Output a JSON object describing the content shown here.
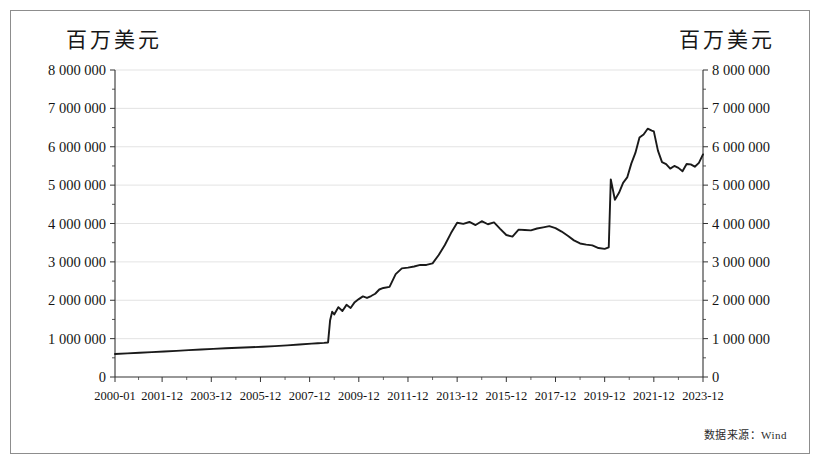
{
  "figure": {
    "left_axis_title": "百万美元",
    "right_axis_title": "百万美元",
    "source_note": "数据来源：Wind",
    "frame_color": "#8d8d8d",
    "line_color": "#1a1a1a",
    "grid_color": "#dcdcdc"
  },
  "chart_data": {
    "type": "line",
    "title": "",
    "subtitle": "",
    "xlabel": "",
    "ylabel": "百万美元",
    "y2label": "百万美元",
    "grid": true,
    "legend": null,
    "ylim": [
      0,
      8000000
    ],
    "ytick_labels": [
      "8 000 000",
      "7 000 000",
      "6 000 000",
      "5 000 000",
      "4 000 000",
      "3 000 000",
      "2 000 000",
      "1 000 000",
      "0"
    ],
    "yticks": [
      8000000,
      7000000,
      6000000,
      5000000,
      4000000,
      3000000,
      2000000,
      1000000,
      0
    ],
    "xtick_labels": [
      "2000-01",
      "2001-12",
      "2003-12",
      "2005-12",
      "2007-12",
      "2009-12",
      "2011-12",
      "2013-12",
      "2015-12",
      "2017-12",
      "2019-12",
      "2021-12",
      "2023-12"
    ],
    "xlim": [
      "2000-01",
      "2023-12"
    ],
    "x_unit": "month",
    "series": [
      {
        "name": "规模",
        "x": [
          "2000-01",
          "2000-07",
          "2001-01",
          "2001-07",
          "2002-01",
          "2002-07",
          "2003-01",
          "2003-07",
          "2004-01",
          "2004-07",
          "2005-01",
          "2005-07",
          "2006-01",
          "2006-07",
          "2007-01",
          "2007-07",
          "2008-01",
          "2008-04",
          "2008-07",
          "2008-09",
          "2008-10",
          "2008-11",
          "2008-12",
          "2009-02",
          "2009-04",
          "2009-06",
          "2009-08",
          "2009-10",
          "2009-12",
          "2010-02",
          "2010-04",
          "2010-06",
          "2010-08",
          "2010-10",
          "2010-12",
          "2011-03",
          "2011-06",
          "2011-09",
          "2011-12",
          "2012-03",
          "2012-06",
          "2012-09",
          "2012-12",
          "2013-03",
          "2013-06",
          "2013-09",
          "2013-12",
          "2014-03",
          "2014-06",
          "2014-09",
          "2014-12",
          "2015-03",
          "2015-06",
          "2015-09",
          "2015-12",
          "2016-03",
          "2016-06",
          "2016-09",
          "2016-12",
          "2017-03",
          "2017-06",
          "2017-09",
          "2017-12",
          "2018-03",
          "2018-06",
          "2018-09",
          "2018-12",
          "2019-03",
          "2019-06",
          "2019-09",
          "2019-12",
          "2020-02",
          "2020-03",
          "2020-05",
          "2020-07",
          "2020-09",
          "2020-11",
          "2021-01",
          "2021-03",
          "2021-05",
          "2021-07",
          "2021-09",
          "2021-11",
          "2021-12",
          "2022-02",
          "2022-04",
          "2022-06",
          "2022-08",
          "2022-10",
          "2022-12",
          "2023-02",
          "2023-04",
          "2023-06",
          "2023-08",
          "2023-10",
          "2023-12"
        ],
        "values": [
          600000,
          615000,
          630000,
          648000,
          665000,
          682000,
          700000,
          718000,
          733000,
          748000,
          762000,
          775000,
          790000,
          805000,
          825000,
          845000,
          870000,
          880000,
          890000,
          900000,
          1480000,
          1700000,
          1630000,
          1820000,
          1720000,
          1880000,
          1800000,
          1950000,
          2030000,
          2100000,
          2060000,
          2110000,
          2170000,
          2280000,
          2320000,
          2350000,
          2680000,
          2830000,
          2850000,
          2880000,
          2920000,
          2920000,
          2960000,
          3180000,
          3440000,
          3750000,
          4020000,
          3990000,
          4040000,
          3960000,
          4060000,
          3980000,
          4030000,
          3860000,
          3700000,
          3660000,
          3840000,
          3830000,
          3820000,
          3870000,
          3900000,
          3930000,
          3880000,
          3790000,
          3680000,
          3560000,
          3480000,
          3450000,
          3430000,
          3360000,
          3340000,
          3380000,
          5150000,
          4620000,
          4800000,
          5060000,
          5200000,
          5560000,
          5840000,
          6240000,
          6320000,
          6470000,
          6420000,
          6400000,
          5900000,
          5600000,
          5550000,
          5430000,
          5500000,
          5450000,
          5360000,
          5550000,
          5540000,
          5480000,
          5580000,
          5800000
        ]
      }
    ],
    "annotations": [
      {
        "label": "2008年金融危机后快速扩张起点",
        "x": "2008-10",
        "y": 1480000
      },
      {
        "label": "2020年疫情后跳升",
        "x": "2020-03",
        "y": 5150000
      },
      {
        "label": "峰值",
        "x": "2021-09",
        "y": 6470000
      }
    ]
  }
}
